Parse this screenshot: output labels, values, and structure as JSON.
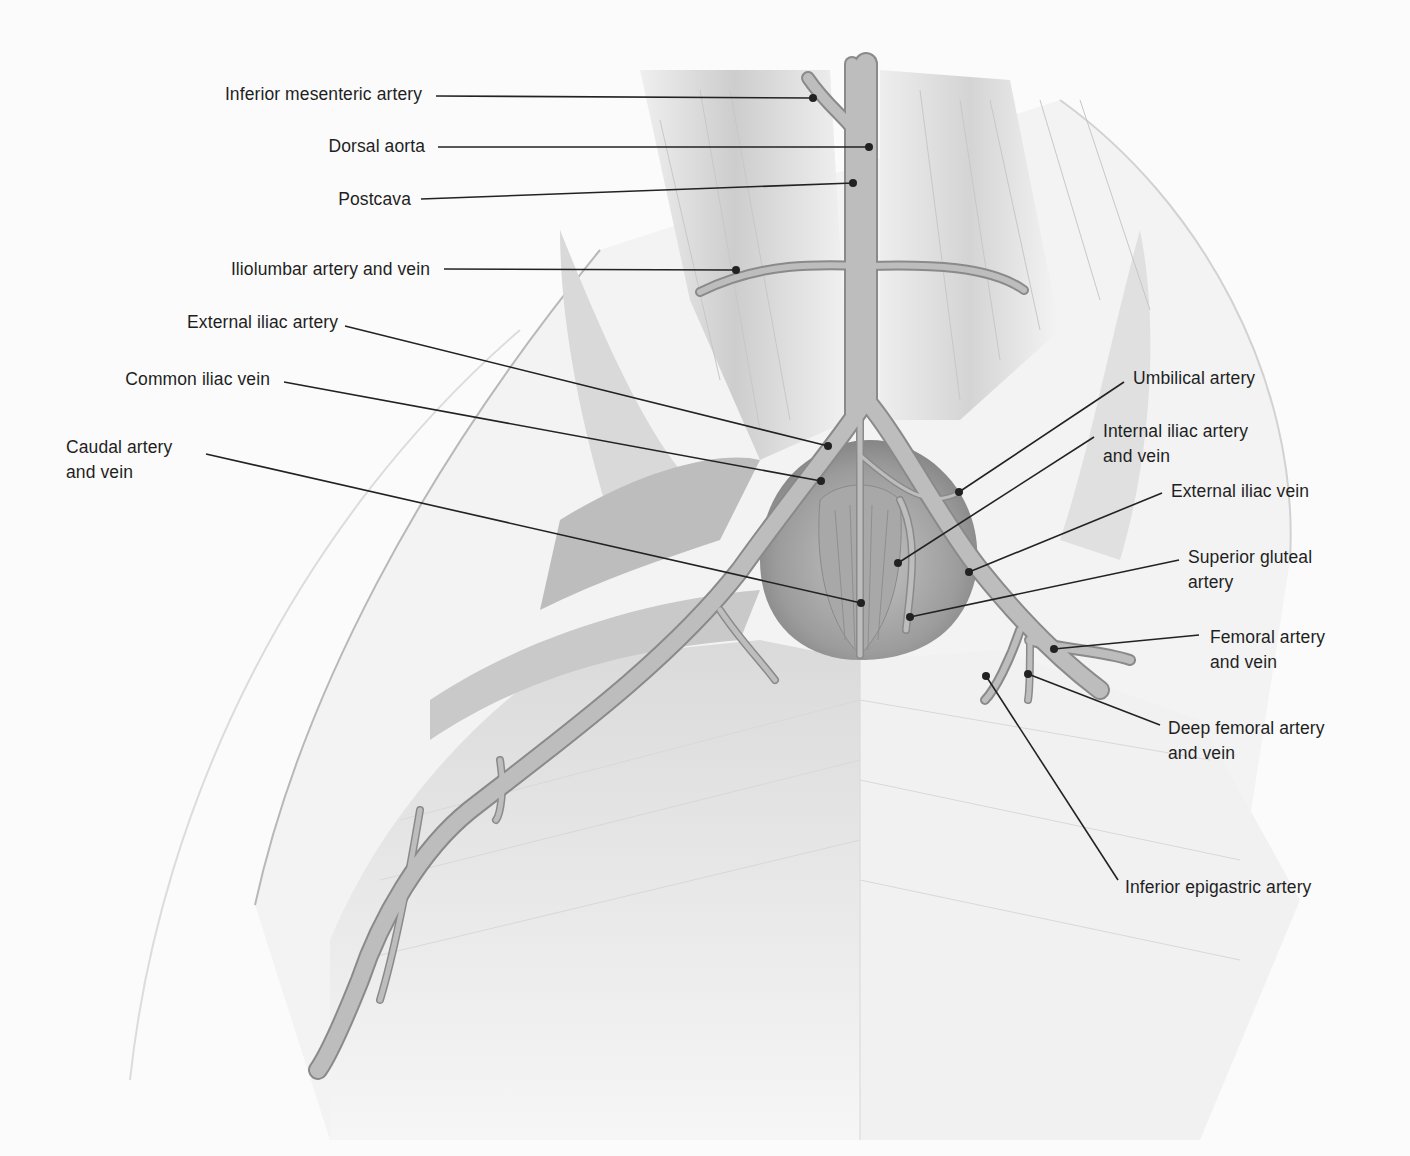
{
  "figure": {
    "colors": {
      "background": "#fbfbfb",
      "muscle_light": "#e9e9e9",
      "muscle_mid": "#cfcfcf",
      "muscle_dark": "#9a9a9a",
      "vessel_fill": "#b9b9b9",
      "vessel_edge": "#8a8a8a",
      "leader_line": "#222222",
      "label_text": "#1f1f1f"
    }
  },
  "labels": [
    {
      "id": "inferior-mesenteric-artery",
      "text": "Inferior mesenteric artery",
      "side": "left",
      "box": [
        0,
        82,
        422,
        25
      ],
      "line_start": [
        436,
        96
      ],
      "line_end": [
        813,
        98
      ]
    },
    {
      "id": "dorsal-aorta",
      "text": "Dorsal aorta",
      "side": "left",
      "box": [
        0,
        134,
        425,
        25
      ],
      "line_start": [
        438,
        147
      ],
      "line_end": [
        869,
        147
      ]
    },
    {
      "id": "postcava",
      "text": "Postcava",
      "side": "left",
      "box": [
        0,
        187,
        411,
        25
      ],
      "line_start": [
        421,
        199
      ],
      "line_end": [
        853,
        183
      ]
    },
    {
      "id": "iliolumbar-artery-and-vein",
      "text": "Iliolumbar artery and vein",
      "side": "left",
      "box": [
        0,
        257,
        430,
        25
      ],
      "line_start": [
        444,
        269
      ],
      "line_end": [
        736,
        270
      ]
    },
    {
      "id": "external-iliac-artery",
      "text": "External iliac artery",
      "side": "left",
      "box": [
        0,
        310,
        338,
        25
      ],
      "line_start": [
        345,
        326
      ],
      "line_end": [
        828,
        446
      ]
    },
    {
      "id": "common-iliac-vein",
      "text": "Common iliac vein",
      "side": "left",
      "box": [
        0,
        367,
        270,
        25
      ],
      "line_start": [
        284,
        382
      ],
      "line_end": [
        821,
        481
      ]
    },
    {
      "id": "caudal-artery-and-vein",
      "text": "Caudal artery\nand vein",
      "side": "left-block",
      "box": [
        66,
        435,
        140,
        50
      ],
      "line_start": [
        206,
        454
      ],
      "line_end": [
        861,
        603
      ]
    },
    {
      "id": "umbilical-artery",
      "text": "Umbilical artery",
      "side": "right",
      "box": [
        1133,
        366,
        200,
        25
      ],
      "line_start": [
        1124,
        382
      ],
      "line_end": [
        959,
        492
      ]
    },
    {
      "id": "internal-iliac-artery-and-vein",
      "text": "Internal iliac artery\nand vein",
      "side": "right",
      "box": [
        1103,
        419,
        200,
        50
      ],
      "line_start": [
        1094,
        437
      ],
      "line_end": [
        898,
        563
      ]
    },
    {
      "id": "external-iliac-vein",
      "text": "External iliac vein",
      "side": "right",
      "box": [
        1171,
        479,
        200,
        25
      ],
      "line_start": [
        1162,
        493
      ],
      "line_end": [
        969,
        572
      ]
    },
    {
      "id": "superior-gluteal-artery",
      "text": "Superior gluteal\nartery",
      "side": "right",
      "box": [
        1188,
        545,
        200,
        50
      ],
      "line_start": [
        1179,
        560
      ],
      "line_end": [
        910,
        617
      ]
    },
    {
      "id": "femoral-artery-and-vein",
      "text": "Femoral artery\nand vein",
      "side": "right",
      "box": [
        1210,
        625,
        200,
        50
      ],
      "line_start": [
        1199,
        635
      ],
      "line_end": [
        1054,
        649
      ]
    },
    {
      "id": "deep-femoral-artery-and-vein",
      "text": "Deep femoral artery\nand vein",
      "side": "right",
      "box": [
        1168,
        716,
        220,
        50
      ],
      "line_start": [
        1160,
        725
      ],
      "line_end": [
        1028,
        674
      ]
    },
    {
      "id": "inferior-epigastric-artery",
      "text": "Inferior epigastric artery",
      "side": "right",
      "box": [
        1125,
        875,
        260,
        25
      ],
      "line_start": [
        1118,
        880
      ],
      "line_end": [
        986,
        676
      ]
    }
  ]
}
